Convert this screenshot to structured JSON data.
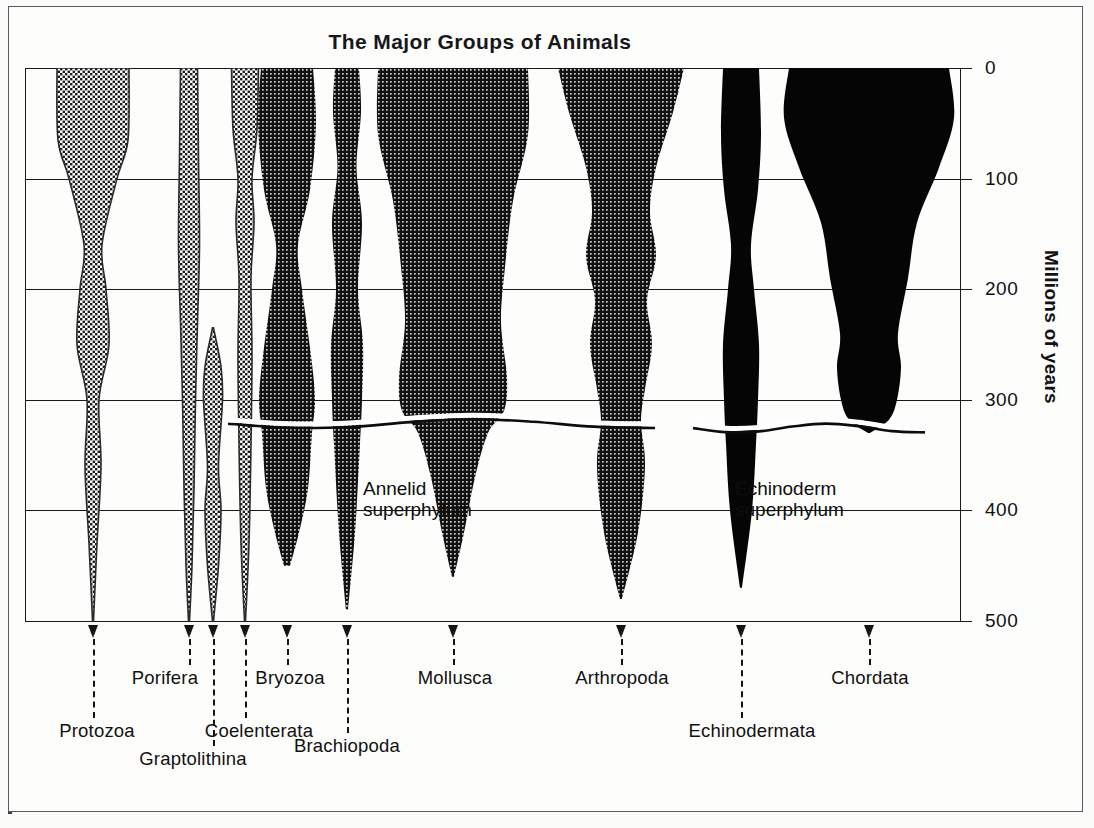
{
  "chart": {
    "title": "The Major Groups of Animals",
    "y_axis_title": "Millions of years",
    "y_ticks": [
      "0",
      "100",
      "200",
      "300",
      "400",
      "500"
    ],
    "in_chart_labels": [
      {
        "id": "annelid",
        "text": "Annelid\nsuperphylum"
      },
      {
        "id": "echinoderm",
        "text": "Echinoderm\nsuperphylum"
      }
    ]
  },
  "chart_data": {
    "type": "area",
    "title": "The Major Groups of Animals",
    "xlabel": "",
    "ylabel": "Millions of years",
    "ylim": [
      500,
      0
    ],
    "y_ticks": [
      0,
      100,
      200,
      300,
      400,
      500
    ],
    "y_axis_direction": "inverted (0 at top, 500 at bottom)",
    "grid": "horizontal gridlines at every 100 million years",
    "legend": "none",
    "annotations": [
      "Annelid superphylum",
      "Echinoderm superphylum"
    ],
    "series": [
      {
        "name": "Protozoa",
        "shade": "light-stipple",
        "first_appearance_mya": 500,
        "top_mya": 0,
        "width_profile": [
          {
            "mya": 0,
            "width": 72
          },
          {
            "mya": 65,
            "width": 70
          },
          {
            "mya": 100,
            "width": 48
          },
          {
            "mya": 160,
            "width": 18
          },
          {
            "mya": 200,
            "width": 26
          },
          {
            "mya": 250,
            "width": 32
          },
          {
            "mya": 300,
            "width": 12
          },
          {
            "mya": 360,
            "width": 16
          },
          {
            "mya": 430,
            "width": 8
          },
          {
            "mya": 500,
            "width": 1
          }
        ]
      },
      {
        "name": "Porifera",
        "shade": "light-stipple",
        "first_appearance_mya": 500,
        "top_mya": 0,
        "width_profile": [
          {
            "mya": 0,
            "width": 17
          },
          {
            "mya": 80,
            "width": 19
          },
          {
            "mya": 160,
            "width": 21
          },
          {
            "mya": 230,
            "width": 17
          },
          {
            "mya": 300,
            "width": 13
          },
          {
            "mya": 380,
            "width": 10
          },
          {
            "mya": 450,
            "width": 6
          },
          {
            "mya": 500,
            "width": 1
          }
        ]
      },
      {
        "name": "Graptolithina",
        "shade": "light-stipple",
        "first_appearance_mya": 500,
        "top_mya": 235,
        "width_profile": [
          {
            "mya": 235,
            "width": 1
          },
          {
            "mya": 270,
            "width": 16
          },
          {
            "mya": 300,
            "width": 19
          },
          {
            "mya": 360,
            "width": 11
          },
          {
            "mya": 400,
            "width": 16
          },
          {
            "mya": 450,
            "width": 11
          },
          {
            "mya": 500,
            "width": 1
          }
        ]
      },
      {
        "name": "Coelenterata",
        "shade": "light-stipple",
        "first_appearance_mya": 500,
        "top_mya": 0,
        "width_profile": [
          {
            "mya": 0,
            "width": 27
          },
          {
            "mya": 55,
            "width": 24
          },
          {
            "mya": 100,
            "width": 14
          },
          {
            "mya": 140,
            "width": 18
          },
          {
            "mya": 190,
            "width": 12
          },
          {
            "mya": 260,
            "width": 14
          },
          {
            "mya": 340,
            "width": 12
          },
          {
            "mya": 430,
            "width": 8
          },
          {
            "mya": 500,
            "width": 1
          }
        ]
      },
      {
        "name": "Bryozoa",
        "shade": "dark-stipple",
        "first_appearance_mya": 480,
        "top_mya": 0,
        "superphylum": "Annelid",
        "width_profile": [
          {
            "mya": 0,
            "width": 52
          },
          {
            "mya": 50,
            "width": 58
          },
          {
            "mya": 110,
            "width": 46
          },
          {
            "mya": 160,
            "width": 22
          },
          {
            "mya": 200,
            "width": 30
          },
          {
            "mya": 260,
            "width": 48
          },
          {
            "mya": 300,
            "width": 56
          },
          {
            "mya": 330,
            "width": 50
          },
          {
            "mya": 380,
            "width": 42
          },
          {
            "mya": 420,
            "width": 24
          },
          {
            "mya": 450,
            "width": 6
          }
        ]
      },
      {
        "name": "Brachiopoda",
        "shade": "dark-stipple",
        "first_appearance_mya": 500,
        "top_mya": 0,
        "superphylum": "Annelid",
        "width_profile": [
          {
            "mya": 0,
            "width": 24
          },
          {
            "mya": 40,
            "width": 28
          },
          {
            "mya": 90,
            "width": 19
          },
          {
            "mya": 140,
            "width": 30
          },
          {
            "mya": 200,
            "width": 22
          },
          {
            "mya": 250,
            "width": 32
          },
          {
            "mya": 300,
            "width": 30
          },
          {
            "mya": 340,
            "width": 26
          },
          {
            "mya": 420,
            "width": 16
          },
          {
            "mya": 490,
            "width": 2
          }
        ]
      },
      {
        "name": "Mollusca",
        "shade": "dark-stipple",
        "first_appearance_mya": 490,
        "top_mya": 0,
        "superphylum": "Annelid",
        "width_profile": [
          {
            "mya": 0,
            "width": 150
          },
          {
            "mya": 60,
            "width": 150
          },
          {
            "mya": 120,
            "width": 120
          },
          {
            "mya": 180,
            "width": 104
          },
          {
            "mya": 230,
            "width": 96
          },
          {
            "mya": 280,
            "width": 108
          },
          {
            "mya": 310,
            "width": 102
          },
          {
            "mya": 330,
            "width": 70
          },
          {
            "mya": 370,
            "width": 44
          },
          {
            "mya": 420,
            "width": 22
          },
          {
            "mya": 460,
            "width": 2
          }
        ]
      },
      {
        "name": "Arthropoda",
        "shade": "dark-stipple",
        "first_appearance_mya": 490,
        "top_mya": 0,
        "superphylum": "Annelid",
        "width_profile": [
          {
            "mya": 0,
            "width": 126
          },
          {
            "mya": 40,
            "width": 104
          },
          {
            "mya": 90,
            "width": 70
          },
          {
            "mya": 130,
            "width": 58
          },
          {
            "mya": 170,
            "width": 70
          },
          {
            "mya": 210,
            "width": 52
          },
          {
            "mya": 250,
            "width": 62
          },
          {
            "mya": 290,
            "width": 48
          },
          {
            "mya": 320,
            "width": 40
          },
          {
            "mya": 360,
            "width": 48
          },
          {
            "mya": 420,
            "width": 34
          },
          {
            "mya": 480,
            "width": 2
          }
        ]
      },
      {
        "name": "Echinodermata",
        "shade": "solid-black",
        "first_appearance_mya": 490,
        "top_mya": 0,
        "superphylum": "Echinoderm",
        "width_profile": [
          {
            "mya": 0,
            "width": 36
          },
          {
            "mya": 60,
            "width": 40
          },
          {
            "mya": 110,
            "width": 34
          },
          {
            "mya": 160,
            "width": 20
          },
          {
            "mya": 200,
            "width": 26
          },
          {
            "mya": 250,
            "width": 36
          },
          {
            "mya": 300,
            "width": 34
          },
          {
            "mya": 340,
            "width": 30
          },
          {
            "mya": 400,
            "width": 22
          },
          {
            "mya": 470,
            "width": 2
          }
        ]
      },
      {
        "name": "Chordata",
        "shade": "solid-black",
        "first_appearance_mya": 330,
        "top_mya": 0,
        "superphylum": "Echinoderm",
        "width_profile": [
          {
            "mya": 0,
            "width": 160
          },
          {
            "mya": 45,
            "width": 170
          },
          {
            "mya": 90,
            "width": 140
          },
          {
            "mya": 140,
            "width": 96
          },
          {
            "mya": 190,
            "width": 78
          },
          {
            "mya": 240,
            "width": 58
          },
          {
            "mya": 270,
            "width": 64
          },
          {
            "mya": 300,
            "width": 56
          },
          {
            "mya": 318,
            "width": 40
          },
          {
            "mya": 330,
            "width": 2
          }
        ]
      }
    ]
  },
  "taxa": [
    {
      "name": "Protozoa",
      "arrow_x": 68,
      "label_x": 72,
      "label_y": 720
    },
    {
      "name": "Porifera",
      "arrow_x": 164,
      "label_x": 140,
      "label_y": 667
    },
    {
      "name": "Graptolithina",
      "arrow_x": 188,
      "label_x": 168,
      "label_y": 748
    },
    {
      "name": "Coelenterata",
      "arrow_x": 220,
      "label_x": 234,
      "label_y": 720
    },
    {
      "name": "Bryozoa",
      "arrow_x": 262,
      "label_x": 265,
      "label_y": 667
    },
    {
      "name": "Brachiopoda",
      "arrow_x": 322,
      "label_x": 322,
      "label_y": 735
    },
    {
      "name": "Mollusca",
      "arrow_x": 428,
      "label_x": 430,
      "label_y": 667
    },
    {
      "name": "Arthropoda",
      "arrow_x": 596,
      "label_x": 597,
      "label_y": 667
    },
    {
      "name": "Echinodermata",
      "arrow_x": 716,
      "label_x": 727,
      "label_y": 720
    },
    {
      "name": "Chordata",
      "arrow_x": 844,
      "label_x": 845,
      "label_y": 667
    }
  ],
  "colors": {
    "ink": "#141414",
    "light_stipple": "#c9c9c9",
    "dark_stipple": "#3a3a3a",
    "solid_black": "#050505",
    "paper": "#fdfdfc"
  }
}
